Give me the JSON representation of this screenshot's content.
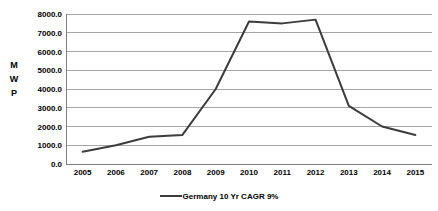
{
  "chart_data": {
    "type": "line",
    "title": "",
    "xlabel": "",
    "ylabel": "MWP",
    "ylabel_chars": [
      "M",
      "W",
      "P"
    ],
    "categories": [
      "2005",
      "2006",
      "2007",
      "2008",
      "2009",
      "2010",
      "2011",
      "2012",
      "2013",
      "2014",
      "2015"
    ],
    "series": [
      {
        "name": "Germany 10 Yr CAGR 9%",
        "color": "#3c3c3c",
        "values": [
          650,
          1000,
          1450,
          1550,
          4000,
          7600,
          7500,
          7700,
          3100,
          2000,
          1550
        ]
      }
    ],
    "ylim": [
      0,
      8000
    ],
    "ytick_values": [
      0,
      1000,
      2000,
      3000,
      4000,
      5000,
      6000,
      7000,
      8000
    ],
    "ytick_labels": [
      "0.0",
      "1000.0",
      "2000.0",
      "3000.0",
      "4000.0",
      "5000.0",
      "6000.0",
      "7000.0",
      "8000.0"
    ],
    "grid": true,
    "grid_color": "#a6a6a6",
    "axis_color": "#808080",
    "legend_position": "bottom"
  },
  "legend": {
    "entries": [
      {
        "label": "Germany 10 Yr CAGR 9%",
        "color": "#3c3c3c"
      }
    ]
  }
}
